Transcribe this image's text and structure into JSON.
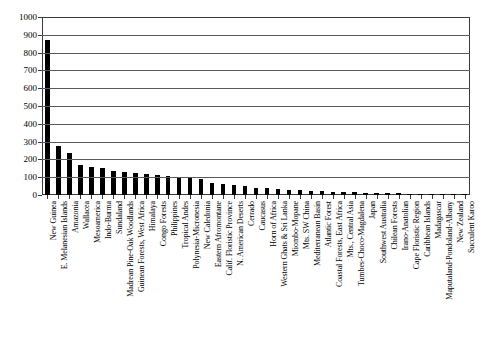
{
  "chart_data": {
    "type": "bar",
    "title": "",
    "subtitle": "",
    "xlabel": "",
    "ylabel": "",
    "ylim": [
      0,
      1000
    ],
    "ytick_labels": [
      "1000",
      "900",
      "800",
      "700",
      "600",
      "500",
      "400",
      "300",
      "200",
      "100",
      "0"
    ],
    "yticks": [
      1000,
      900,
      800,
      700,
      600,
      500,
      400,
      300,
      200,
      100,
      0
    ],
    "grid": true,
    "legend": "none",
    "bar_color": "#000000",
    "categories": [
      "New Guinea",
      "E. Melanesian Islands",
      "Amazonia",
      "Wallacea",
      "Mesoamerica",
      "Indo-Burma",
      "Sundaland",
      "Madrean Pine-Oak Woodlands",
      "Guinean Forests, West Africa",
      "Himalaya",
      "Congo Forests",
      "Philippines",
      "Tropical Andes",
      "Polynesia-Micronesia",
      "New Caledonia",
      "Eastern Afromontane",
      "Calif. Floristic Province",
      "N. American Deserts",
      "Cerrado",
      "Caucasus",
      "Horn of Africa",
      "Western Ghats & Sri Lanka",
      "Miombo-Mopane",
      "Mts. SW China",
      "Mediterranean Basin",
      "Atlantic Forest",
      "Coastal Forests, East Africa",
      "Mts., Central Asia",
      "Tumbes-Choco-Magdalena",
      "Japan",
      "Southwest Australia",
      "Chilean Forests",
      "Irano-Anatolian",
      "Cape Floristic Region",
      "Caribbean Islands",
      "Madagascar",
      "Maputaland-Pondoland-Albany",
      "New Zealand",
      "Succulent Karoo"
    ],
    "values": [
      870,
      275,
      235,
      170,
      160,
      150,
      135,
      128,
      122,
      118,
      110,
      105,
      100,
      95,
      88,
      70,
      62,
      55,
      48,
      42,
      38,
      34,
      30,
      27,
      24,
      21,
      19,
      17,
      15,
      13,
      11,
      10,
      9,
      8,
      7,
      6,
      5,
      4,
      3
    ]
  }
}
